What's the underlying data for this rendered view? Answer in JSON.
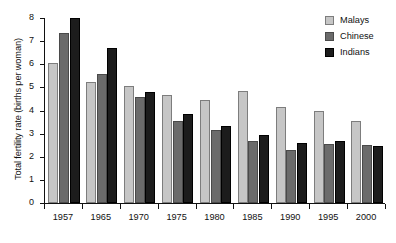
{
  "chart_data": {
    "type": "bar",
    "title": "",
    "subtitle": "",
    "xlabel": "",
    "ylabel": "Total fertility rate (births per woman)",
    "categories": [
      "1957",
      "1965",
      "1970",
      "1975",
      "1980",
      "1985",
      "1990",
      "1995",
      "2000"
    ],
    "series": [
      {
        "name": "Malays",
        "color": "#c6c6c6",
        "values": [
          6.05,
          5.25,
          5.05,
          4.65,
          4.45,
          4.85,
          4.15,
          4.0,
          3.55
        ]
      },
      {
        "name": "Chinese",
        "color": "#6b6b6b",
        "values": [
          7.35,
          5.6,
          4.6,
          3.55,
          3.15,
          2.7,
          2.3,
          2.55,
          2.5
        ]
      },
      {
        "name": "Indians",
        "color": "#1c1c1c",
        "values": [
          8.0,
          6.7,
          4.8,
          3.85,
          3.35,
          2.95,
          2.6,
          2.7,
          2.45
        ]
      }
    ],
    "ylim": [
      0,
      8
    ],
    "yticks": [
      0,
      1,
      2,
      3,
      4,
      5,
      6,
      7,
      8
    ],
    "ytick_labels": [
      "0",
      "1",
      "2",
      "3",
      "4",
      "5",
      "6",
      "7",
      "8"
    ],
    "grid": false,
    "legend_position": "top-right",
    "legend_entries": [
      "Malays",
      "Chinese",
      "Indians"
    ]
  }
}
